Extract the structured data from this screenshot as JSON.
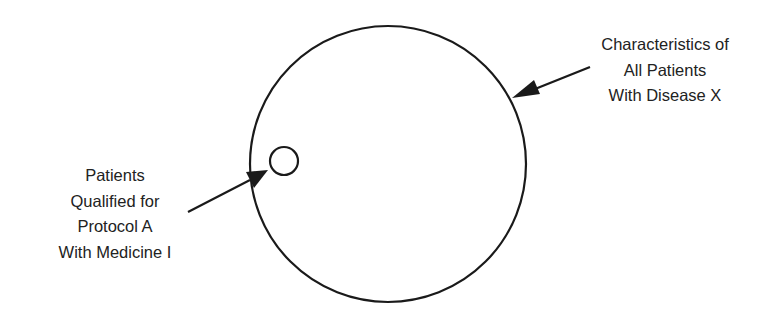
{
  "diagram": {
    "large_circle": {
      "label_lines": [
        "Characteristics of",
        "All Patients",
        "With Disease X"
      ],
      "cx": 388,
      "cy": 164,
      "r": 138
    },
    "small_circle": {
      "label_lines": [
        "Patients",
        "Qualified for",
        "Protocol A",
        "With Medicine I"
      ],
      "cx": 284,
      "cy": 161,
      "r": 14
    },
    "colors": {
      "stroke": "#1a1a1a",
      "text": "#222222",
      "background": "#ffffff"
    }
  }
}
